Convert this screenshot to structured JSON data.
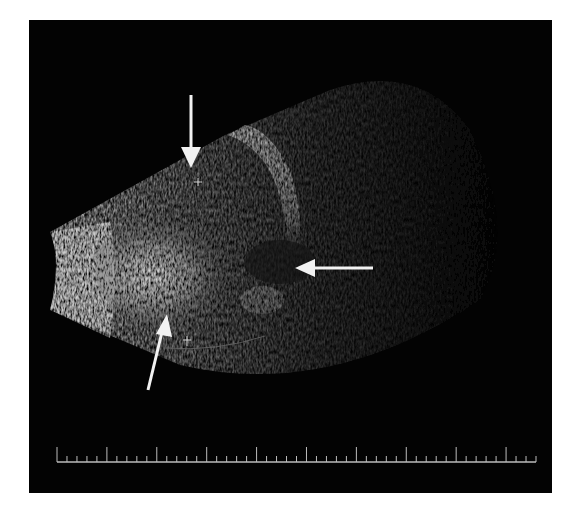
{
  "image": {
    "kind": "ultrasound-b-scan",
    "background_color": "#030303",
    "page_color": "#ffffff",
    "tissue_highlight_color": "#d8d8d8",
    "arrow_color": "#f2f2f2"
  },
  "annotations": {
    "arrows": [
      {
        "name": "arrow-down",
        "direction": "down",
        "tail": [
          191,
          95
        ],
        "head": [
          191,
          168
        ]
      },
      {
        "name": "arrow-left",
        "direction": "left",
        "tail": [
          373,
          268
        ],
        "head": [
          295,
          268
        ]
      },
      {
        "name": "arrow-up",
        "direction": "up-right",
        "tail": [
          148,
          390
        ],
        "head": [
          167,
          315
        ]
      }
    ],
    "caliper_markers": [
      {
        "name": "caliper-top",
        "position": [
          198,
          182
        ]
      },
      {
        "name": "caliper-bottom",
        "position": [
          187,
          341
        ]
      }
    ]
  },
  "scale_bar": {
    "x_start": 57,
    "x_end": 536,
    "y": 462,
    "minor_ticks": 48,
    "major_tick_every": 5
  }
}
